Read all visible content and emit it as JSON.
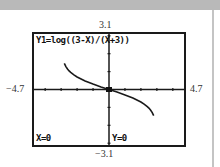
{
  "calculator": {
    "equation": "Y1=log((3-X)/(X+3))",
    "cursor_x": "X=0",
    "cursor_y": "Y=0"
  },
  "window": {
    "ymax_label": "3.1",
    "ymin_label": "−3.1",
    "xmin_label": "−4.7",
    "xmax_label": "4.7"
  },
  "chart_data": {
    "type": "line",
    "title": "Y1=log((3-X)/(X+3))",
    "xlabel": "",
    "ylabel": "",
    "xlim": [
      -4.7,
      4.7
    ],
    "ylim": [
      -3.1,
      3.1
    ],
    "xscl": 1,
    "yscl": 1,
    "grid": false,
    "trace_point": {
      "x": 0,
      "y": 0
    },
    "series": [
      {
        "name": "Y1",
        "x": [
          -2.8,
          -2.7,
          -2.6,
          -2.5,
          -2.4,
          -2.2,
          -2.0,
          -1.5,
          -1.0,
          -0.5,
          0,
          0.5,
          1.0,
          1.5,
          2.0,
          2.2,
          2.4,
          2.5,
          2.6,
          2.7,
          2.8
        ],
        "values": [
          1.462,
          1.279,
          1.146,
          1.041,
          0.954,
          0.813,
          0.699,
          0.477,
          0.301,
          0.146,
          0,
          -0.146,
          -0.301,
          -0.477,
          -0.699,
          -0.813,
          -0.954,
          -1.041,
          -1.146,
          -1.279,
          -1.462
        ]
      }
    ]
  }
}
